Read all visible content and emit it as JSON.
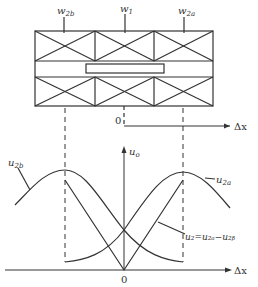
{
  "diagram": {
    "type": "differential transformer displacement sensor schematic with output characteristic",
    "top_labels": {
      "w2b": {
        "main": "w",
        "sub": "2b"
      },
      "w1": {
        "main": "w",
        "sub": "1"
      },
      "w2a": {
        "main": "w",
        "sub": "2a"
      }
    },
    "top_axis": {
      "origin": "0",
      "x_label": "Δx"
    },
    "bottom_axis": {
      "origin": "0",
      "x_label": "Δx",
      "y_label": {
        "main": "u",
        "sub": "o"
      }
    },
    "curve_labels": {
      "u2b": {
        "main": "u",
        "sub": "2b"
      },
      "u2a": {
        "main": "u",
        "sub": "2a"
      },
      "u2": "u₂=u₂ₐ−u₂ᵦ"
    },
    "colors": {
      "stroke": "#333333",
      "background": "#ffffff"
    }
  }
}
